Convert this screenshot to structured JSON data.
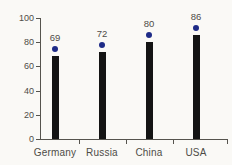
{
  "chart_data": {
    "type": "bar",
    "categories": [
      "Germany",
      "Russia",
      "China",
      "USA"
    ],
    "values": [
      69,
      72,
      80,
      86
    ],
    "value_labels": [
      "69",
      "72",
      "80",
      "86"
    ],
    "title": "",
    "xlabel": "",
    "ylabel": "",
    "ylim": [
      0,
      100
    ],
    "yticks": [
      0,
      20,
      40,
      60,
      80,
      100
    ],
    "grid": false,
    "legend": false,
    "colors": {
      "background": "#faf9f6",
      "bar": "#141414",
      "dot": "#1e2b87",
      "axis": "#56544e",
      "text": "#4e4c47"
    }
  }
}
